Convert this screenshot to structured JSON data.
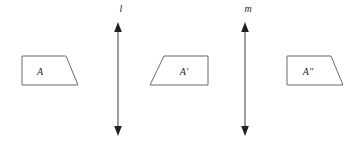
{
  "figure": {
    "background_color": "#ffffff",
    "shape_stroke_color": "#6b6b6b",
    "line_stroke_color": "#3a3a3a",
    "label_color": "#1f1f1f",
    "width": 361,
    "height": 145
  },
  "shapes": [
    {
      "id": "shape-a",
      "label": "A",
      "label_x": 40,
      "label_y": 75,
      "points": "22,56 66,56 78,85 22,85",
      "orientation": "slant-right",
      "description": "trapezoid with vertical left edge and slanted right edge"
    },
    {
      "id": "shape-a-prime",
      "label": "A′",
      "label_x": 184,
      "label_y": 75,
      "points": "164,56 208,56 208,85 150,85",
      "orientation": "slant-left",
      "description": "trapezoid reflected across line l, slanted left edge"
    },
    {
      "id": "shape-a-double-prime",
      "label": "A″",
      "label_x": 308,
      "label_y": 75,
      "points": "287,56 331,56 343,85 287,85",
      "orientation": "slant-right",
      "description": "trapezoid reflected across line m, slanted right edge"
    }
  ],
  "mirror_lines": [
    {
      "id": "line-l",
      "label": "l",
      "x": 118,
      "y_top": 25,
      "y_bottom": 133,
      "label_x": 121,
      "label_y": 12,
      "arrowheads": "both"
    },
    {
      "id": "line-m",
      "label": "m",
      "x": 245,
      "y_top": 25,
      "y_bottom": 133,
      "label_x": 248,
      "label_y": 12,
      "arrowheads": "both"
    }
  ]
}
